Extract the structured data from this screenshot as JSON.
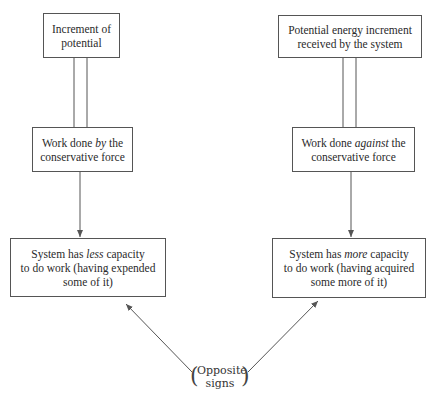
{
  "diagram": {
    "left_column": {
      "top_box": {
        "text": "Increment of potential",
        "lines": [
          "Increment of",
          "potential"
        ]
      },
      "middle_box": {
        "pre": "Work done ",
        "emph": "by",
        "post": " the",
        "line2": "conservative force"
      },
      "bottom_box": {
        "pre": "System has ",
        "emph": "less",
        "post": " capacity",
        "line2": "to do work (having expended",
        "line3": "some of it)"
      },
      "link_top_to_middle": "double-line (equivalence)",
      "link_middle_to_bottom": "arrow"
    },
    "right_column": {
      "top_box": {
        "text": "Potential energy increment received by the system",
        "lines": [
          "Potential energy increment",
          "received by the system"
        ]
      },
      "middle_box": {
        "pre": "Work done ",
        "emph": "against",
        "post": " the",
        "line2": "conservative force"
      },
      "bottom_box": {
        "pre": "System has ",
        "emph": "more",
        "post": " capacity",
        "line2": "to do work (having acquired",
        "line3": "some more of it)"
      },
      "link_top_to_middle": "double-line (equivalence)",
      "link_middle_to_bottom": "arrow"
    },
    "bottom_label": {
      "line1": "Opposite",
      "line2": "signs",
      "open": "(",
      "close": ")"
    },
    "colors": {
      "line": "#555555",
      "text": "#2a2a2a",
      "background": "#ffffff"
    }
  }
}
